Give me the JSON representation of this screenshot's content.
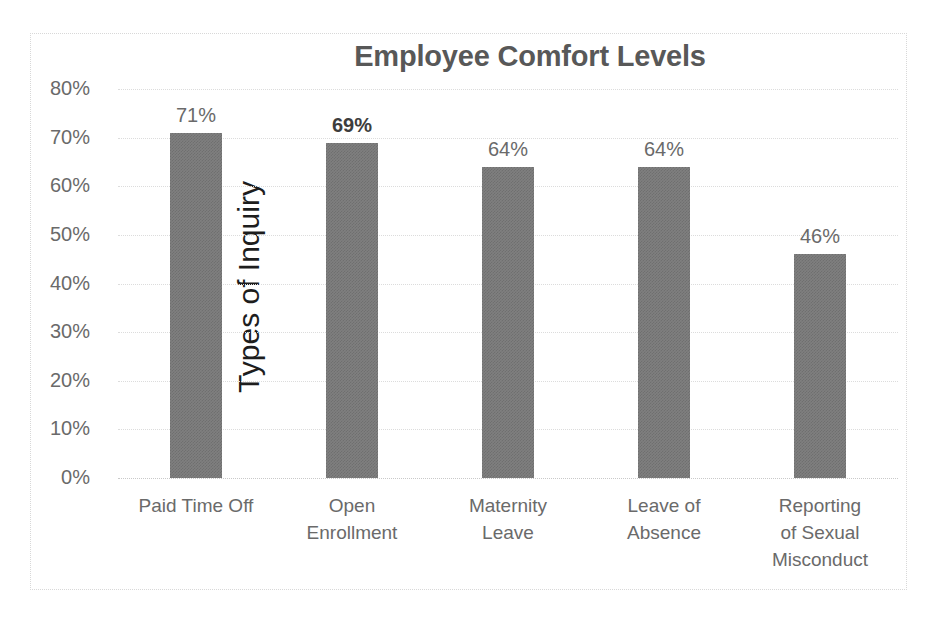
{
  "chart_data": {
    "type": "bar",
    "title": "Employee Comfort Levels",
    "xlabel": "",
    "ylabel": "Types of Inquiry",
    "categories": [
      "Paid Time Off",
      "Open Enrollment",
      "Maternity Leave",
      "Leave of Absence",
      "Reporting of Sexual Misconduct"
    ],
    "category_lines": [
      [
        "Paid Time Off"
      ],
      [
        "Open",
        "Enrollment"
      ],
      [
        "Maternity",
        "Leave"
      ],
      [
        "Leave of",
        "Absence"
      ],
      [
        "Reporting",
        "of Sexual",
        "Misconduct"
      ]
    ],
    "values": [
      71,
      69,
      64,
      64,
      46
    ],
    "data_labels": [
      "71%",
      "69%",
      "64%",
      "64%",
      "46%"
    ],
    "emphasized_labels": [
      false,
      true,
      false,
      false,
      false
    ],
    "ylim": [
      0,
      80
    ],
    "ytick_values": [
      80,
      70,
      60,
      50,
      40,
      30,
      20,
      10,
      0
    ],
    "ytick_labels": [
      "80%",
      "70%",
      "60%",
      "50%",
      "40%",
      "30%",
      "20%",
      "10%",
      "0%"
    ],
    "grid": true,
    "grid_style": "dotted-horizontal",
    "legend": false,
    "bar_color": "#7f7f7f",
    "title_color": "#585858",
    "tick_color": "#6a6a6a",
    "axis_title_color": "#1d1d1d",
    "gridline_color": "#dcdcdc",
    "background_color": "#ffffff"
  }
}
